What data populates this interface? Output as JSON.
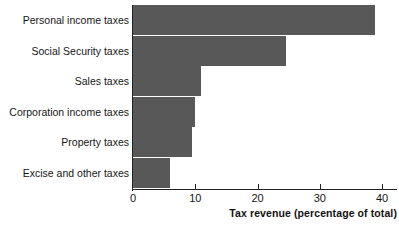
{
  "chart_data": {
    "type": "bar",
    "orientation": "horizontal",
    "title": "",
    "xlabel": "Tax revenue (percentage of total)",
    "ylabel": "",
    "xlim": [
      0,
      40
    ],
    "xticks": [
      0,
      10,
      20,
      30,
      40
    ],
    "xtick_labels": [
      "0",
      "10",
      "20",
      "30",
      "40"
    ],
    "grid": false,
    "legend": false,
    "bar_color": "#585858",
    "axis_color": "#222222",
    "background": "#ffffff",
    "categories": [
      "Personal income taxes",
      "Social Security taxes",
      "Sales taxes",
      "Corporation income taxes",
      "Property taxes",
      "Excise and other taxes"
    ],
    "values": [
      38.9,
      24.5,
      11.0,
      10.0,
      9.4,
      6.0
    ]
  }
}
